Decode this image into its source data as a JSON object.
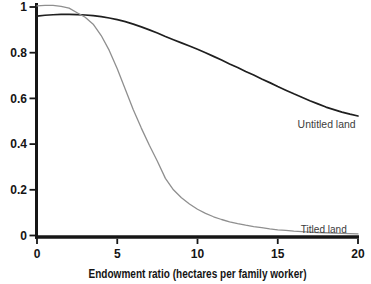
{
  "figure": {
    "background": "#ffffff",
    "axis_color": "#161616",
    "text_color": "#151515"
  },
  "chart_data": {
    "type": "line",
    "title": "",
    "xlabel": "Endowment ratio (hectares per family worker)",
    "ylabel": "",
    "xlim": [
      0,
      20
    ],
    "ylim": [
      0,
      1
    ],
    "grid": false,
    "legend": "inline-labels-at-line-ends",
    "x_ticks": [
      {
        "value": 0,
        "label": "0"
      },
      {
        "value": 5,
        "label": "5"
      },
      {
        "value": 10,
        "label": "10"
      },
      {
        "value": 15,
        "label": "15"
      },
      {
        "value": 20,
        "label": "20"
      }
    ],
    "y_ticks": [
      {
        "value": 0,
        "label": "0"
      },
      {
        "value": 0.2,
        "label": "0.2"
      },
      {
        "value": 0.4,
        "label": "0.4"
      },
      {
        "value": 0.6,
        "label": "0.6"
      },
      {
        "value": 0.8,
        "label": "0.8"
      },
      {
        "value": 1,
        "label": "1"
      }
    ],
    "x": [
      0,
      0.5,
      1,
      1.5,
      2,
      2.5,
      3,
      3.5,
      4,
      4.5,
      5,
      5.5,
      6,
      6.5,
      7,
      7.5,
      8,
      8.5,
      9,
      9.5,
      10,
      10.5,
      11,
      11.5,
      12,
      12.5,
      13,
      13.5,
      14,
      14.5,
      15,
      15.5,
      16,
      16.5,
      17,
      17.5,
      18,
      18.5,
      19,
      19.5,
      20
    ],
    "series": [
      {
        "name": "Untitled land",
        "color": "#1f1f1f",
        "stroke_width": 1.7,
        "label_x": 19.85,
        "label_y": 0.47,
        "values": [
          0.96,
          0.964,
          0.966,
          0.968,
          0.968,
          0.967,
          0.965,
          0.962,
          0.958,
          0.952,
          0.945,
          0.936,
          0.925,
          0.913,
          0.9,
          0.886,
          0.871,
          0.857,
          0.843,
          0.829,
          0.815,
          0.8,
          0.784,
          0.768,
          0.751,
          0.735,
          0.718,
          0.702,
          0.685,
          0.669,
          0.652,
          0.636,
          0.62,
          0.605,
          0.59,
          0.576,
          0.562,
          0.551,
          0.54,
          0.531,
          0.523
        ]
      },
      {
        "name": "Titled land",
        "color": "#8f8f8f",
        "stroke_width": 1.3,
        "label_x": 19.3,
        "label_y": 0.013,
        "values": [
          1.005,
          1.007,
          1.007,
          1.003,
          0.995,
          0.975,
          0.955,
          0.925,
          0.875,
          0.81,
          0.73,
          0.64,
          0.55,
          0.47,
          0.395,
          0.325,
          0.25,
          0.2,
          0.165,
          0.138,
          0.115,
          0.097,
          0.082,
          0.07,
          0.06,
          0.052,
          0.045,
          0.039,
          0.034,
          0.029,
          0.025,
          0.022,
          0.019,
          0.017,
          0.015,
          0.013,
          0.012,
          0.01,
          0.009,
          0.008,
          0.007
        ]
      }
    ]
  }
}
